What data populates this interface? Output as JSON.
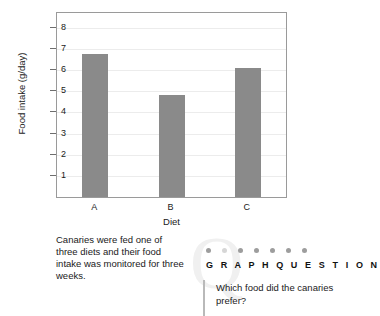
{
  "chart_data": {
    "type": "bar",
    "title": "",
    "categories": [
      "A",
      "B",
      "C"
    ],
    "values": [
      6.75,
      4.8,
      6.1
    ],
    "xlabel": "Diet",
    "ylabel": "Food intake (g/day)",
    "ylim": [
      0,
      8.7
    ],
    "yticks": [
      8,
      7,
      6,
      5,
      4,
      3,
      2,
      1
    ],
    "grid": true,
    "legend": "none",
    "bar_color": "#8a8a8a",
    "gridline_color": "#ececec",
    "frame_color": "#9a9a9a"
  },
  "caption": {
    "text": "Canaries were fed one of three diets and their food intake was monitored for three weeks."
  },
  "question_panel": {
    "watermark": "Q",
    "heading": "G R A P H   Q U E S T I O N",
    "dots_count": 7,
    "question": "Which food did the canaries prefer?"
  }
}
